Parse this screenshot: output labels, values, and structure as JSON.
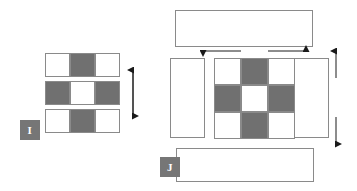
{
  "figure": {
    "background_color": "#ffffff",
    "stroke_color": "#8a8a8a",
    "fill_gray": "#707070",
    "fill_white": "#ffffff",
    "label_chip_color": "#767676",
    "label_text_color": "#ffffff"
  },
  "panels": [
    {
      "id": "I",
      "label": "I",
      "description": "three stacked three-cell bars with alternating checker fill",
      "rows": [
        {
          "name": "top-bar",
          "cells": [
            "white",
            "gray",
            "white"
          ]
        },
        {
          "name": "middle-bar",
          "cells": [
            "gray",
            "white",
            "gray"
          ]
        },
        {
          "name": "bottom-bar",
          "cells": [
            "white",
            "gray",
            "white"
          ]
        }
      ],
      "arrows": [
        {
          "name": "vertical-double-arrow",
          "orientation": "vertical",
          "heads": "both"
        }
      ]
    },
    {
      "id": "J",
      "label": "J",
      "description": "central three-by-three checker block surrounded by four plain rectangles",
      "center_grid": [
        [
          "white",
          "gray",
          "white"
        ],
        [
          "gray",
          "white",
          "gray"
        ],
        [
          "white",
          "gray",
          "white"
        ]
      ],
      "surrounding_rects": [
        {
          "name": "top-rect"
        },
        {
          "name": "left-rect"
        },
        {
          "name": "right-rect"
        },
        {
          "name": "bottom-rect"
        }
      ],
      "arrows": [
        {
          "name": "left-arrow",
          "orientation": "horizontal",
          "heads": "left"
        },
        {
          "name": "right-arrow",
          "orientation": "horizontal",
          "heads": "right"
        },
        {
          "name": "up-arrow",
          "orientation": "vertical",
          "heads": "up"
        },
        {
          "name": "down-arrow",
          "orientation": "vertical",
          "heads": "down"
        }
      ]
    }
  ]
}
